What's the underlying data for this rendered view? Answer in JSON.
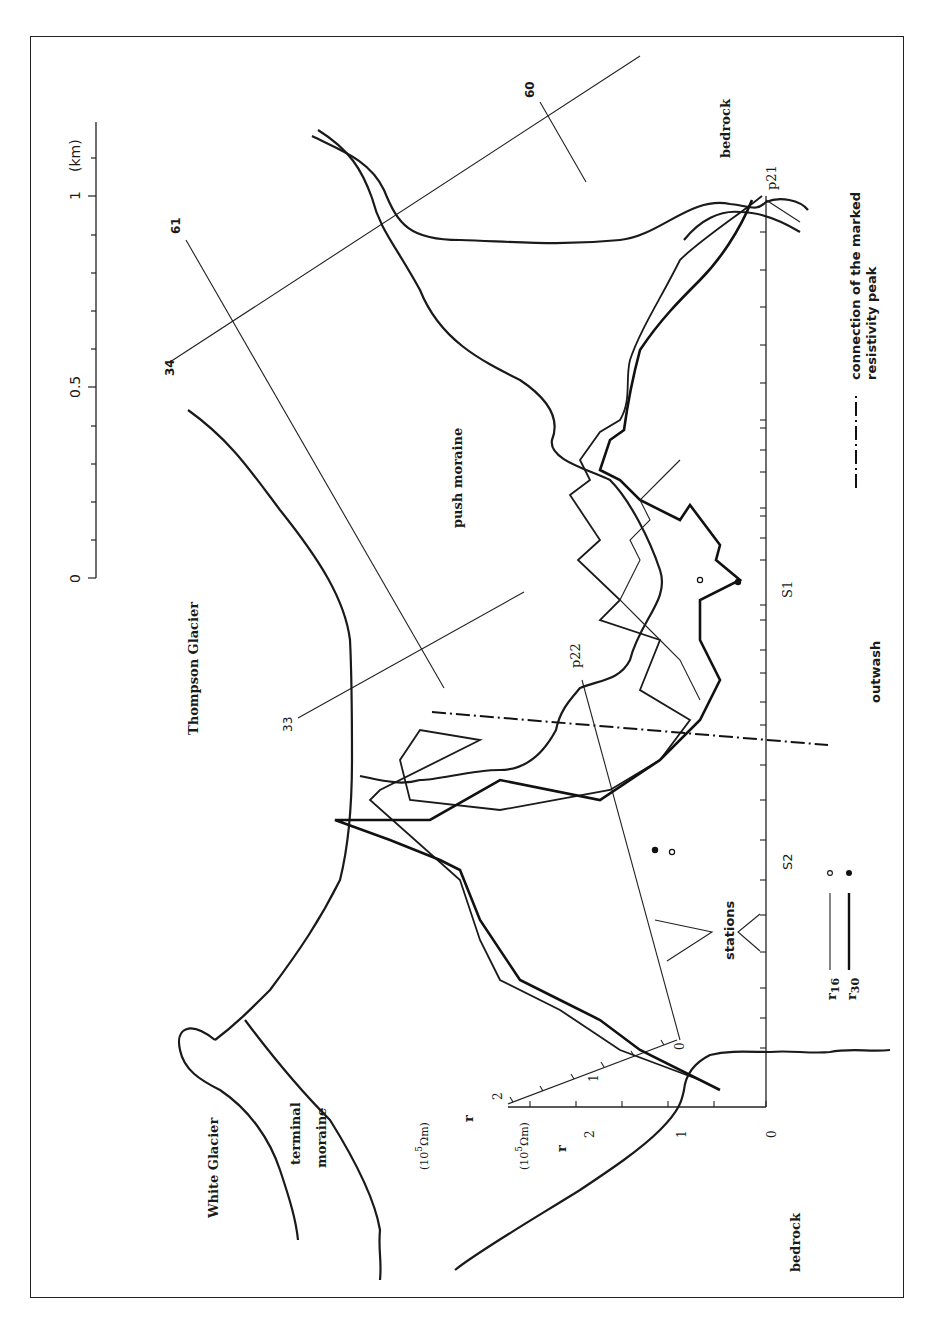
{
  "figure": {
    "orientation": "rotated 90deg counter-clockwise",
    "scale_bar": {
      "ticks": [
        "0",
        "0.5",
        "1"
      ],
      "unit": "(km)"
    },
    "regions": {
      "thompson_glacier": "Thompson Glacier",
      "white_glacier": "White Glacier",
      "terminal_moraine_line1": "terminal",
      "terminal_moraine_line2": "moraine",
      "push_moraine": "push moraine",
      "outwash": "outwash",
      "bedrock_top": "bedrock",
      "bedrock_bottom": "bedrock"
    },
    "profile_labels": {
      "p21": "p21",
      "p22": "p22",
      "s1": "S1",
      "s2": "S2"
    },
    "line_labels": {
      "l33": "33",
      "l34": "34",
      "l60": "60",
      "l61": "61"
    },
    "stations_label": "stations",
    "axes": {
      "r_axis_1": {
        "symbol": "r",
        "unit": "(10⁵ Ωm)",
        "unit_base": "(10",
        "unit_exp": "5",
        "unit_tail": "Ωm)",
        "ticks": [
          "0",
          "1",
          "2"
        ]
      },
      "r_axis_2": {
        "symbol": "r",
        "unit_base": "(10",
        "unit_exp": "5",
        "unit_tail": "Ωm)",
        "ticks": [
          "0",
          "1",
          "2"
        ]
      }
    },
    "legend": {
      "r16": {
        "symbol": "r",
        "subscript": "16",
        "marker": "◦",
        "style": "thin line"
      },
      "r30": {
        "symbol": "r",
        "subscript": "30",
        "marker": "•",
        "style": "thick line"
      },
      "dashdot_line1": "connection of the marked",
      "dashdot_line2": "resistivity peak"
    },
    "colors": {
      "ink": "#1a1a1a",
      "paper": "#ffffff"
    }
  }
}
